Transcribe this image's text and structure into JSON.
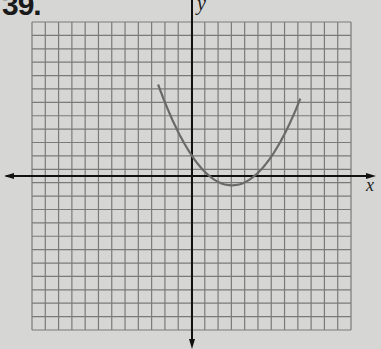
{
  "problem": {
    "number": "39."
  },
  "chart_data": {
    "type": "line",
    "title": "",
    "xlabel": "x",
    "ylabel": "y",
    "grid": true,
    "grid_columns": 24,
    "grid_rows": 23,
    "xlim": [
      -12,
      12
    ],
    "ylim": [
      -11.5,
      11.5
    ],
    "tick_labels": [],
    "series": [
      {
        "name": "parabola",
        "description": "upward-opening parabola, vertex near (3, -0.7), y-intercept near 1.5",
        "points": [
          {
            "x": -2.6,
            "y": 11.1
          },
          {
            "x": -1.5,
            "y": 6.5
          },
          {
            "x": 0,
            "y": 1.5
          },
          {
            "x": 1,
            "y": 0.2
          },
          {
            "x": 2,
            "y": -0.5
          },
          {
            "x": 3,
            "y": -0.7
          },
          {
            "x": 4,
            "y": -0.4
          },
          {
            "x": 5,
            "y": 0.8
          },
          {
            "x": 6.5,
            "y": 4.5
          },
          {
            "x": 8.1,
            "y": 11.5
          }
        ]
      }
    ]
  },
  "colors": {
    "background": "#d6d6d4",
    "grid": "#7a7a7a",
    "axis": "#111111",
    "curve": "#6a6a6a"
  }
}
